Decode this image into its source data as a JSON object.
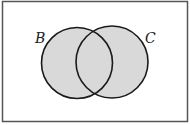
{
  "diagram": {
    "type": "venn",
    "sets": [
      {
        "label": "B",
        "shaded": true
      },
      {
        "label": "C",
        "shaded": true
      }
    ],
    "shaded_region": "B ∪ C",
    "colors": {
      "fill": "#d9d9d9",
      "stroke": "#1a1a1a",
      "frame": "#555555"
    }
  }
}
